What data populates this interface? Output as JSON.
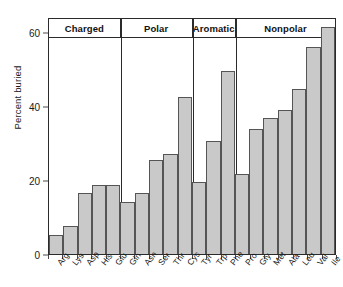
{
  "chart_data": {
    "type": "bar",
    "title": "",
    "xlabel": "",
    "ylabel": "Percent buried",
    "ylim": [
      0,
      64
    ],
    "yticks": [
      0,
      20,
      40,
      60
    ],
    "grid": false,
    "legend": null,
    "categories": [
      "Arg",
      "Lys",
      "Asp",
      "His",
      "Glu",
      "Gln",
      "Asn",
      "Ser",
      "Thr",
      "Cys",
      "Tyr",
      "Trp",
      "Phe",
      "Pro",
      "Gly",
      "Met",
      "Ala",
      "Leu",
      "Val",
      "Ile"
    ],
    "values": [
      5.0,
      7.5,
      16.5,
      18.7,
      18.7,
      14.0,
      16.5,
      25.5,
      27.0,
      42.5,
      19.5,
      30.5,
      49.5,
      21.5,
      33.7,
      36.7,
      39.0,
      44.5,
      56.0,
      61.3
    ],
    "groups": [
      {
        "label": "Charged",
        "count": 5,
        "members": [
          "Arg",
          "Lys",
          "Asp",
          "His",
          "Glu"
        ]
      },
      {
        "label": "Polar",
        "count": 5,
        "members": [
          "Gln",
          "Asn",
          "Ser",
          "Thr",
          "Cys"
        ]
      },
      {
        "label": "Aromatic",
        "count": 3,
        "members": [
          "Tyr",
          "Trp",
          "Phe"
        ]
      },
      {
        "label": "Nonpolar",
        "count": 7,
        "members": [
          "Pro",
          "Gly",
          "Met",
          "Ala",
          "Leu",
          "Val",
          "Ile"
        ]
      }
    ],
    "colors": {
      "bar_fill": "#c9c9c9",
      "bar_edge": "#555555",
      "axis": "#2b2b2b",
      "text": "#1a1a1a",
      "background": "#ffffff"
    }
  }
}
